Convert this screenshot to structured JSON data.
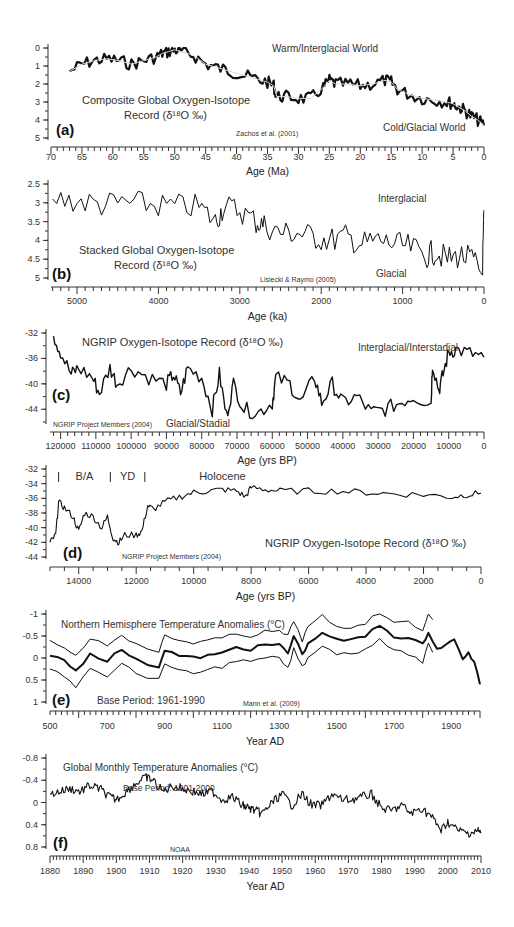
{
  "chart_data": [
    {
      "panel": "(a)",
      "type": "line",
      "title": "Composite Global Oxygen-Isotope Record (δ18O ‰)",
      "title_line1": "Composite Global Oxygen-Isotope",
      "title_line2": "Record (δ¹⁸O ‰)",
      "xlabel": "Age (Ma)",
      "ylabel": "",
      "xlim": [
        70,
        0
      ],
      "ylim": [
        0,
        5
      ],
      "y_inverted": true,
      "x_ticks": [
        70,
        65,
        60,
        55,
        50,
        45,
        40,
        35,
        30,
        25,
        20,
        15,
        10,
        5,
        0
      ],
      "y_ticks": [
        0,
        1,
        2,
        3,
        4,
        5
      ],
      "annotations": [
        "Warm/Interglacial World",
        "Cold/Glacial World",
        "Zachos et al. (2001)"
      ],
      "x": [
        67,
        65,
        63,
        61,
        59,
        57,
        55,
        53,
        52,
        51,
        50,
        49,
        47,
        45,
        43,
        41,
        39,
        37,
        35,
        34,
        33.5,
        32,
        30,
        28,
        26,
        25,
        24,
        22,
        20,
        18,
        16,
        15,
        14,
        12,
        10,
        8,
        6,
        5,
        4,
        3,
        2,
        1,
        0
      ],
      "values": [
        1.3,
        0.9,
        0.7,
        0.6,
        0.7,
        0.9,
        0.7,
        0.5,
        0.3,
        0.2,
        0.1,
        0.2,
        0.4,
        0.9,
        1.1,
        1.3,
        1.5,
        1.7,
        1.9,
        2.1,
        2.7,
        2.7,
        2.8,
        2.8,
        2.2,
        1.8,
        2.0,
        2.0,
        2.1,
        2.0,
        1.8,
        1.9,
        2.3,
        2.6,
        2.8,
        2.9,
        3.0,
        3.1,
        3.3,
        3.5,
        3.8,
        4.0,
        4.3
      ]
    },
    {
      "panel": "(b)",
      "type": "line",
      "title": "Stacked Global Oxygen-Isotope Record (δ18O ‰)",
      "title_line1": "Stacked Global Oxygen-Isotope",
      "title_line2": "Record (δ¹⁸O ‰)",
      "xlabel": "Age (ka)",
      "ylabel": "",
      "xlim": [
        5320,
        0
      ],
      "ylim": [
        2.5,
        5
      ],
      "y_inverted": true,
      "x_ticks": [
        5000,
        4000,
        3000,
        2000,
        1000,
        0
      ],
      "y_ticks": [
        2.5,
        3,
        3.5,
        4,
        4.5,
        5
      ],
      "annotations": [
        "Interglacial",
        "Glacial",
        "Lisiecki & Raymo (2005)"
      ],
      "x": [
        5300,
        5000,
        4700,
        4400,
        4100,
        3800,
        3500,
        3300,
        3200,
        3000,
        2800,
        2700,
        2500,
        2300,
        2100,
        1900,
        1700,
        1500,
        1300,
        1100,
        900,
        700,
        600,
        450,
        300,
        150,
        20,
        0
      ],
      "values": [
        2.9,
        2.95,
        3.05,
        3.0,
        3.05,
        3.1,
        3.1,
        3.5,
        3.1,
        3.2,
        3.5,
        3.6,
        3.8,
        3.8,
        3.9,
        4.0,
        3.9,
        4.1,
        4.0,
        4.1,
        4.2,
        4.4,
        4.3,
        4.5,
        4.4,
        4.5,
        4.9,
        3.2
      ]
    },
    {
      "panel": "(c)",
      "type": "line",
      "title": "NGRIP Oxygen-Isotope Record (δ18O ‰)",
      "xlabel": "Age (yrs BP)",
      "ylabel": "",
      "xlim": [
        123000,
        0
      ],
      "ylim": [
        -32,
        -46
      ],
      "x_ticks": [
        120000,
        110000,
        100000,
        90000,
        80000,
        70000,
        60000,
        50000,
        40000,
        30000,
        20000,
        10000,
        0
      ],
      "y_ticks": [
        -32,
        -36,
        -40,
        -44
      ],
      "annotations": [
        "Interglacial/Interstadial",
        "Glacial/Stadial",
        "NGRIP Project Members (2004)"
      ],
      "x": [
        122000,
        120000,
        117000,
        115000,
        111000,
        109000,
        106000,
        104000,
        100000,
        95000,
        90000,
        88000,
        86000,
        84000,
        80000,
        77000,
        75000,
        73000,
        71000,
        68000,
        64000,
        60000,
        59000,
        55000,
        52000,
        48000,
        46000,
        43000,
        40000,
        36000,
        32000,
        28000,
        24000,
        20000,
        15000,
        14600,
        12800,
        11600,
        10000,
        8000,
        4000,
        0
      ],
      "values": [
        -32.5,
        -35,
        -38.5,
        -37.5,
        -39,
        -41.5,
        -37.5,
        -40,
        -37.5,
        -39,
        -40,
        -38.5,
        -41.5,
        -37.5,
        -39,
        -44,
        -38.5,
        -45,
        -40,
        -44,
        -44.5,
        -43,
        -39,
        -40,
        -43,
        -39,
        -43,
        -40,
        -43,
        -42,
        -44.5,
        -44,
        -43,
        -42,
        -43,
        -36.8,
        -41,
        -38.5,
        -35,
        -34.6,
        -35.2,
        -35.8
      ]
    },
    {
      "panel": "(d)",
      "type": "line",
      "title": "NGRIP Oxygen-Isotope Record (δ18O ‰)",
      "xlabel": "Age (yrs BP)",
      "ylabel": "",
      "xlim": [
        15000,
        0
      ],
      "ylim": [
        -32,
        -44
      ],
      "x_ticks": [
        14000,
        12000,
        10000,
        8000,
        6000,
        4000,
        2000,
        0
      ],
      "y_ticks": [
        -32,
        -34,
        -36,
        -38,
        -40,
        -42,
        -44
      ],
      "period_labels": [
        "B/A",
        "YD",
        "Holocene"
      ],
      "period_boundaries": [
        14700,
        12900,
        11700
      ],
      "annotations": [
        "NGRIP Project Members (2004)"
      ],
      "x": [
        15000,
        14800,
        14700,
        14500,
        14200,
        14000,
        13800,
        13500,
        13200,
        13000,
        12800,
        12600,
        12400,
        12000,
        11800,
        11600,
        11400,
        11000,
        10500,
        10000,
        9500,
        9000,
        8500,
        8200,
        8000,
        7500,
        7000,
        6000,
        5000,
        4000,
        3000,
        2000,
        1000,
        500,
        0
      ],
      "values": [
        -42,
        -41,
        -36.5,
        -37.3,
        -38.5,
        -40.5,
        -38,
        -38.5,
        -40,
        -38.5,
        -41.5,
        -42,
        -41,
        -41,
        -40.5,
        -37,
        -37.5,
        -36.5,
        -35.8,
        -35.2,
        -35,
        -34.8,
        -35,
        -35.8,
        -34.5,
        -34.8,
        -35,
        -35,
        -35,
        -35.2,
        -35.4,
        -35.5,
        -35.8,
        -35.5,
        -35.3
      ]
    },
    {
      "panel": "(e)",
      "type": "line",
      "title": "Northern Hemisphere Temperature Anomalies (°C)",
      "xlabel": "Year AD",
      "ylabel": "",
      "xlim": [
        500,
        2000
      ],
      "ylim": [
        -1,
        1
      ],
      "x_ticks": [
        500,
        700,
        900,
        1100,
        1300,
        1500,
        1700,
        1900
      ],
      "y_ticks": [
        1,
        0.5,
        0,
        -0.5,
        -1
      ],
      "annotations": [
        "Base Period: 1961-1990",
        "Mann et al. (2009)"
      ],
      "x": [
        500,
        550,
        590,
        640,
        700,
        750,
        800,
        880,
        900,
        950,
        1000,
        1050,
        1100,
        1150,
        1200,
        1250,
        1300,
        1330,
        1350,
        1380,
        1400,
        1450,
        1500,
        1550,
        1600,
        1650,
        1700,
        1750,
        1800,
        1820,
        1850,
        1880,
        1910,
        1940,
        1960,
        1980,
        2000
      ],
      "series": [
        {
          "name": "reconstruction",
          "values": [
            -0.05,
            0.05,
            0.3,
            -0.1,
            0.05,
            -0.2,
            0.05,
            0.2,
            -0.2,
            -0.05,
            0.0,
            -0.05,
            -0.1,
            -0.25,
            -0.2,
            -0.3,
            -0.3,
            -0.1,
            -0.5,
            -0.1,
            -0.3,
            -0.6,
            -0.4,
            -0.4,
            -0.5,
            -0.75,
            -0.5,
            -0.45,
            -0.3,
            -0.6,
            -0.2,
            -0.3,
            -0.4,
            0.0,
            -0.1,
            0.1,
            0.6
          ]
        },
        {
          "name": "upper_bound",
          "values": [
            0.25,
            0.4,
            0.65,
            0.2,
            0.4,
            0.1,
            0.35,
            0.5,
            0.1,
            0.3,
            0.35,
            0.25,
            0.2,
            0.05,
            0.1,
            -0.0,
            0.0,
            0.25,
            -0.2,
            0.2,
            0.0,
            -0.3,
            -0.1,
            -0.1,
            -0.2,
            -0.45,
            -0.15,
            -0.1,
            0.1,
            -0.3,
            0.1,
            null,
            null,
            null,
            null,
            null,
            null
          ]
        },
        {
          "name": "lower_bound",
          "values": [
            -0.4,
            -0.25,
            -0.05,
            -0.45,
            -0.3,
            -0.55,
            -0.3,
            -0.15,
            -0.5,
            -0.4,
            -0.35,
            -0.4,
            -0.45,
            -0.55,
            -0.5,
            -0.6,
            -0.6,
            -0.5,
            -0.85,
            -0.4,
            -0.7,
            -0.95,
            -0.7,
            -0.7,
            -0.8,
            -1.05,
            -0.85,
            -0.8,
            -0.65,
            -1.0,
            -0.7,
            null,
            null,
            null,
            null,
            null,
            null
          ]
        }
      ]
    },
    {
      "panel": "(f)",
      "type": "line",
      "title": "Global Monthly Temperature Anomalies (°C)",
      "xlabel": "Year AD",
      "ylabel": "",
      "xlim": [
        1880,
        2010
      ],
      "ylim": [
        -0.8,
        0.8
      ],
      "x_ticks": [
        1880,
        1890,
        1900,
        1910,
        1920,
        1930,
        1940,
        1950,
        1960,
        1970,
        1980,
        1990,
        2000,
        2010
      ],
      "y_ticks": [
        0.8,
        0.4,
        0,
        -0.4,
        -0.8
      ],
      "annotations": [
        "Base Period: 1901-2000",
        "NOAA"
      ],
      "x": [
        1880,
        1883,
        1886,
        1889,
        1892,
        1895,
        1898,
        1900,
        1903,
        1906,
        1909,
        1911,
        1914,
        1917,
        1920,
        1923,
        1926,
        1929,
        1932,
        1935,
        1938,
        1940,
        1942,
        1944,
        1947,
        1950,
        1953,
        1956,
        1959,
        1962,
        1965,
        1968,
        1971,
        1974,
        1977,
        1980,
        1983,
        1986,
        1989,
        1992,
        1995,
        1998,
        2000,
        2003,
        2006,
        2009,
        2010
      ],
      "values": [
        -0.15,
        -0.2,
        -0.25,
        -0.2,
        -0.3,
        -0.25,
        -0.1,
        -0.05,
        -0.2,
        -0.35,
        -0.45,
        -0.4,
        -0.2,
        -0.3,
        -0.25,
        -0.2,
        -0.15,
        -0.2,
        -0.05,
        -0.1,
        0.05,
        0.1,
        0.15,
        0.2,
        0.0,
        -0.15,
        0.05,
        -0.15,
        0.05,
        0.05,
        -0.15,
        -0.05,
        -0.05,
        -0.1,
        -0.15,
        0.1,
        0.15,
        0.05,
        0.2,
        0.1,
        0.25,
        0.5,
        0.35,
        0.5,
        0.55,
        0.5,
        0.55
      ]
    }
  ]
}
